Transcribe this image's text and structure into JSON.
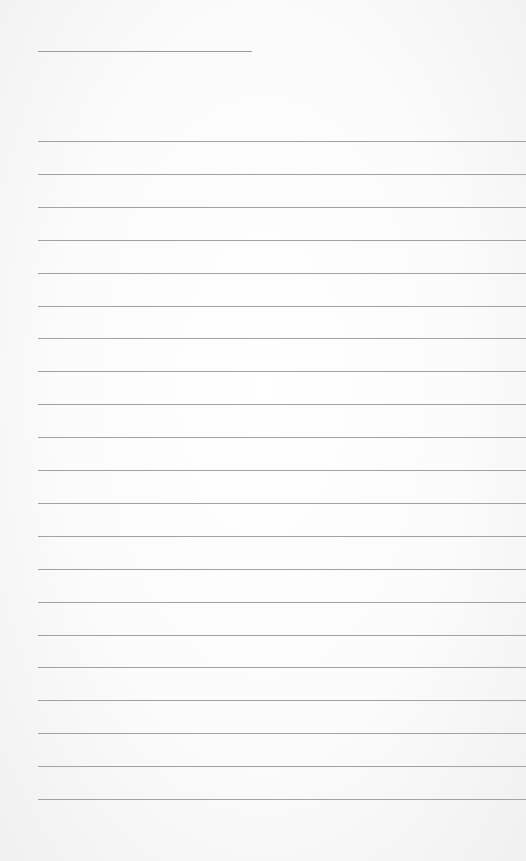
{
  "page": {
    "type": "lined-notepad",
    "background_color": "#fbfbfb",
    "line_color": "#a2a2a2",
    "title_line": {
      "present": true,
      "text": ""
    },
    "line_count": 21,
    "first_line_y": 141,
    "line_spacing": 32.9,
    "lines": [
      "",
      "",
      "",
      "",
      "",
      "",
      "",
      "",
      "",
      "",
      "",
      "",
      "",
      "",
      "",
      "",
      "",
      "",
      "",
      "",
      ""
    ]
  }
}
